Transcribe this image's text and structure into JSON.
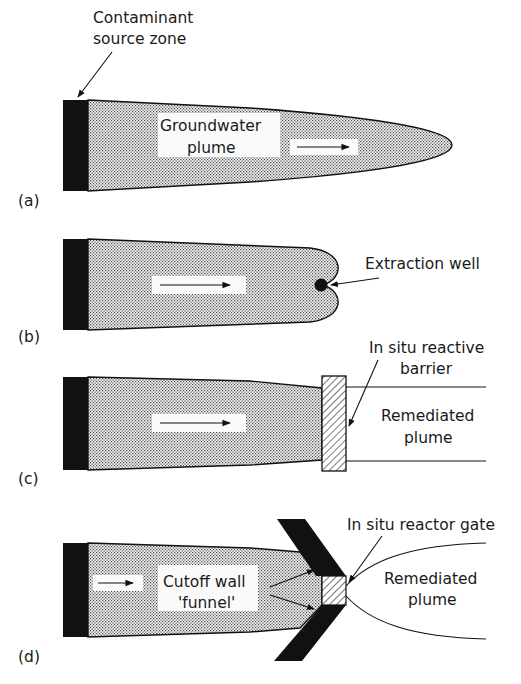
{
  "figure": {
    "panels": {
      "a": {
        "label": "(a)",
        "source_label_line1": "Contaminant",
        "source_label_line2": "source zone",
        "plume_label_line1": "Groundwater",
        "plume_label_line2": "plume"
      },
      "b": {
        "label": "(b)",
        "well_label": "Extraction well"
      },
      "c": {
        "label": "(c)",
        "barrier_label_line1": "In situ reactive",
        "barrier_label_line2": "barrier",
        "remediated_label_line1": "Remediated",
        "remediated_label_line2": "plume"
      },
      "d": {
        "label": "(d)",
        "gate_label": "In situ reactor gate",
        "funnel_label_line1": "Cutoff wall",
        "funnel_label_line2": "'funnel'",
        "remediated_label_line1": "Remediated",
        "remediated_label_line2": "plume"
      }
    },
    "colors": {
      "ink": "#111111",
      "background": "#ffffff",
      "stipple": "#555555"
    }
  }
}
